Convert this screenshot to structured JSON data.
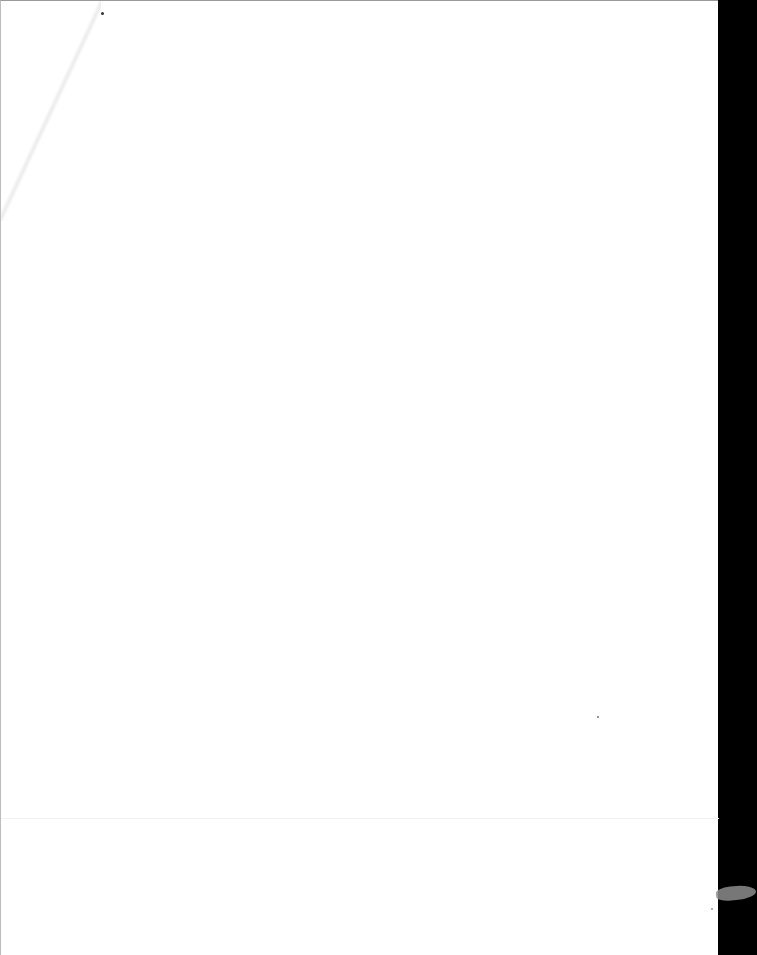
{
  "document": {
    "type": "scanned-page",
    "content": "",
    "page_color": "#ffffff",
    "border_color": "#000000"
  }
}
